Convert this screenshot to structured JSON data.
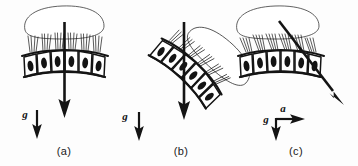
{
  "figure": {
    "background_color": "#fdfdfd",
    "ink_color": "#141414",
    "panels": [
      {
        "id": "a",
        "caption": "(a)",
        "description": "Upright macula; otolithic membrane resting evenly on hair cells",
        "tilt_degrees": 0,
        "resultant_arrow": {
          "label": "",
          "direction_degrees": 270,
          "length": 70
        },
        "vectors": [
          {
            "name": "g",
            "label": "g",
            "direction_degrees": 270
          }
        ],
        "hair_cell_count": 6
      },
      {
        "id": "b",
        "caption": "(b)",
        "description": "Tilted macula; otolithic membrane slides downhill shearing the hair bundles",
        "tilt_degrees": 45,
        "resultant_arrow": {
          "label": "",
          "direction_degrees": 270,
          "length": 70
        },
        "vectors": [
          {
            "name": "g",
            "label": "g",
            "direction_degrees": 270
          }
        ],
        "hair_cell_count": 6
      },
      {
        "id": "c",
        "caption": "(c)",
        "description": "Upright macula under linear acceleration; resultant of gravity and acceleration shears the membrane",
        "tilt_degrees": 0,
        "resultant_arrow": {
          "label": "",
          "direction_degrees": 315,
          "length": 95
        },
        "vectors": [
          {
            "name": "a",
            "label": "a",
            "direction_degrees": 0
          },
          {
            "name": "g",
            "label": "g",
            "direction_degrees": 270
          }
        ],
        "hair_cell_count": 6
      }
    ],
    "legend_labels": {
      "gravity": "g",
      "acceleration": "a"
    }
  }
}
